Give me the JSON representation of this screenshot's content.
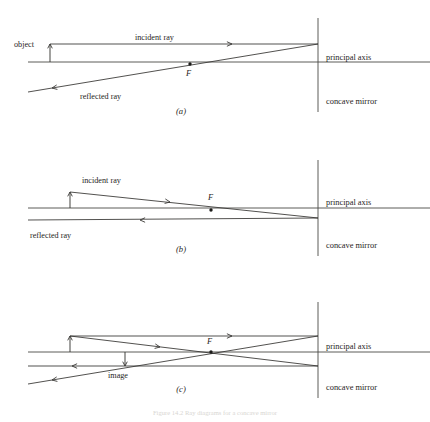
{
  "figure": {
    "title": "Ray diagrams for a concave mirror",
    "caption": "Figure 14.2  Ray diagrams for a concave mirror",
    "background_color": "#ffffff",
    "ink_color": "#1f1e1c"
  },
  "labels": {
    "object": "object",
    "image": "image",
    "incident_ray": "incident ray",
    "reflected_ray": "reflected ray",
    "principal_axis": "principal axis",
    "concave_mirror": "concave mirror",
    "focal_point": "F"
  },
  "panels": [
    {
      "id": "panel-a",
      "tag": "(a)",
      "tag_x": 181,
      "tag_y": 114,
      "description": "Object beyond centre of curvature: incident ray parallel to axis reflects through F",
      "axis_y": 62,
      "mirror_x": 318,
      "mirror_top": 18,
      "mirror_bottom": 112,
      "axis_x_start": 28,
      "axis_x_end": 430,
      "focal_point": {
        "x": 190,
        "y": 64,
        "label_x": 186,
        "label_y": 76
      },
      "object": {
        "base_x": 50,
        "base_y": 62,
        "tip_x": 50,
        "tip_y": 44,
        "label_x": 14,
        "label_y": 47
      },
      "rays": [
        {
          "name": "incident-ray",
          "x1": 50,
          "y1": 44,
          "x2": 318,
          "y2": 44,
          "label": "incident ray",
          "label_x": 135,
          "label_y": 40,
          "arrow_x": 232,
          "arrow_y": 44,
          "arrow_dir": "right"
        },
        {
          "name": "reflected-ray",
          "x1": 318,
          "y1": 44,
          "x2": 28,
          "y2": 92,
          "label": "reflected ray",
          "label_x": 80,
          "label_y": 99,
          "arrow_x": 52,
          "arrow_y": 88,
          "arrow_dir": "left-down"
        }
      ],
      "right_labels": [
        {
          "name": "principal-axis-label",
          "text": "principal axis",
          "x": 326,
          "y": 60
        },
        {
          "name": "concave-mirror-label",
          "text": "concave mirror",
          "x": 326,
          "y": 104
        }
      ]
    },
    {
      "id": "panel-b",
      "tag": "(b)",
      "tag_x": 181,
      "tag_y": 252,
      "description": "Incident ray through F reflects parallel to the principal axis",
      "axis_y": 208,
      "mirror_x": 318,
      "mirror_top": 160,
      "mirror_bottom": 256,
      "axis_x_start": 28,
      "axis_x_end": 430,
      "focal_point": {
        "x": 211,
        "y": 210,
        "label_x": 208,
        "label_y": 200
      },
      "object": {
        "base_x": 70,
        "base_y": 208,
        "tip_x": 70,
        "tip_y": 192,
        "label_x": 0,
        "label_y": 0
      },
      "rays": [
        {
          "name": "incident-ray",
          "x1": 70,
          "y1": 192,
          "x2": 318,
          "y2": 218,
          "label": "incident ray",
          "label_x": 82,
          "label_y": 183,
          "arrow_x": 170,
          "arrow_y": 202,
          "arrow_dir": "right-down"
        },
        {
          "name": "reflected-ray",
          "x1": 318,
          "y1": 218,
          "x2": 28,
          "y2": 220,
          "label": "reflected ray",
          "label_x": 30,
          "label_y": 238,
          "arrow_x": 140,
          "arrow_y": 220,
          "arrow_dir": "left"
        }
      ],
      "right_labels": [
        {
          "name": "principal-axis-label",
          "text": "principal axis",
          "x": 326,
          "y": 205
        },
        {
          "name": "concave-mirror-label",
          "text": "concave mirror",
          "x": 326,
          "y": 248
        }
      ]
    },
    {
      "id": "panel-c",
      "tag": "(c)",
      "tag_x": 181,
      "tag_y": 392,
      "description": "Both rays combined locate the real inverted image between F and the mirror",
      "axis_y": 352,
      "mirror_x": 318,
      "mirror_top": 302,
      "mirror_bottom": 398,
      "axis_x_start": 28,
      "axis_x_end": 430,
      "focal_point": {
        "x": 211,
        "y": 352,
        "label_x": 207,
        "label_y": 344
      },
      "object": {
        "base_x": 70,
        "base_y": 352,
        "tip_x": 70,
        "tip_y": 336,
        "label_x": 0,
        "label_y": 0
      },
      "image": {
        "base_x": 125,
        "base_y": 352,
        "tip_x": 125,
        "tip_y": 366,
        "label_x": 108,
        "label_y": 378
      },
      "rays": [
        {
          "name": "incident-ray-parallel",
          "x1": 70,
          "y1": 336,
          "x2": 318,
          "y2": 336,
          "label": "",
          "label_x": 0,
          "label_y": 0,
          "arrow_x": 232,
          "arrow_y": 336,
          "arrow_dir": "right"
        },
        {
          "name": "reflected-ray-through-f",
          "x1": 318,
          "y1": 336,
          "x2": 28,
          "y2": 384,
          "label": "",
          "label_x": 0,
          "label_y": 0,
          "arrow_x": 52,
          "arrow_y": 380,
          "arrow_dir": "left-down"
        },
        {
          "name": "incident-ray-through-f",
          "x1": 70,
          "y1": 336,
          "x2": 318,
          "y2": 366,
          "label": "",
          "label_x": 0,
          "label_y": 0,
          "arrow_x": 160,
          "arrow_y": 347,
          "arrow_dir": "right-down"
        },
        {
          "name": "reflected-ray-parallel",
          "x1": 318,
          "y1": 366,
          "x2": 28,
          "y2": 366,
          "label": "",
          "label_x": 0,
          "label_y": 0,
          "arrow_x": 72,
          "arrow_y": 366,
          "arrow_dir": "left"
        }
      ],
      "right_labels": [
        {
          "name": "principal-axis-label",
          "text": "principal axis",
          "x": 326,
          "y": 349
        },
        {
          "name": "concave-mirror-label",
          "text": "concave mirror",
          "x": 326,
          "y": 390
        }
      ]
    }
  ]
}
